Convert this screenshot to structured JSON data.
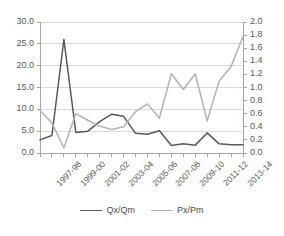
{
  "chart_data": {
    "type": "line",
    "title": "",
    "xlabel": "",
    "ylabel": "",
    "categories": [
      "1997-98",
      "1998-99",
      "1999-00",
      "2000-01",
      "2001-02",
      "2002-03",
      "2003-04",
      "2004-05",
      "2005-06",
      "2006-07",
      "2007-08",
      "2008-09",
      "2009-10",
      "2010-11",
      "2011-12",
      "2012-13",
      "2013-14",
      "2014-15"
    ],
    "tick_labels": [
      "1997-98",
      "1999-00",
      "2001-02",
      "2003-04",
      "2005-06",
      "2007-08",
      "2009-10",
      "2011-12",
      "2013-14"
    ],
    "tick_label_interval": 2,
    "grid": true,
    "legend_position": "bottom",
    "series": [
      {
        "name": "Qx/Qm",
        "axis": "left",
        "color": "#595959",
        "values": [
          3.0,
          4.0,
          26.0,
          4.7,
          5.0,
          7.2,
          8.9,
          8.4,
          4.5,
          4.3,
          5.1,
          1.7,
          2.1,
          1.8,
          4.6,
          2.1,
          1.9,
          1.9
        ]
      },
      {
        "name": "Px/Pm",
        "axis": "right",
        "color": "#b3b3b3",
        "values": [
          0.65,
          0.46,
          0.08,
          0.6,
          0.5,
          0.41,
          0.36,
          0.4,
          0.63,
          0.75,
          0.53,
          1.21,
          0.97,
          1.21,
          0.49,
          1.1,
          1.32,
          1.78
        ]
      }
    ],
    "left_axis": {
      "ticks": [
        "0.0",
        "5.0",
        "10.0",
        "15.0",
        "20.0",
        "25.0",
        "30.0"
      ],
      "min": 0.0,
      "max": 30.0,
      "step": 5.0
    },
    "right_axis": {
      "ticks": [
        "0.0",
        "0.2",
        "0.4",
        "0.6",
        "0.8",
        "1.0",
        "1.2",
        "1.4",
        "1.6",
        "1.8",
        "2.0"
      ],
      "min": 0.0,
      "max": 2.0,
      "step": 0.2
    },
    "legend": [
      {
        "label": "Qx/Qm",
        "color": "#595959"
      },
      {
        "label": "Px/Pm",
        "color": "#b3b3b3"
      }
    ],
    "colors": {
      "qx_qm": "#595959",
      "px_pm": "#b3b3b3",
      "grid": "#d9d9d9",
      "axis": "#a6a6a6",
      "text": "#595959"
    }
  }
}
